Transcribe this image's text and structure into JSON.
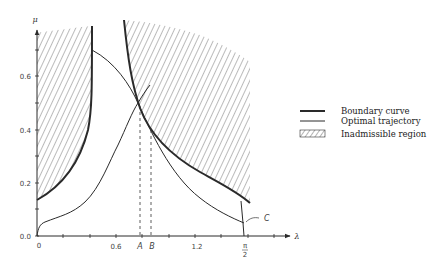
{
  "figure": {
    "axes": {
      "x_label": "λ",
      "y_label": "μ",
      "x_ticks": [
        {
          "label": "0",
          "value": 0
        },
        {
          "label": "0.6",
          "value": 0.6
        },
        {
          "label": "1.2",
          "value": 1.2
        }
      ],
      "x_special": [
        {
          "label": "A",
          "value": 0.78
        },
        {
          "label": "B",
          "value": 0.86
        },
        {
          "label_num": "π",
          "label_den": "2",
          "value": 1.5708
        }
      ],
      "y_ticks": [
        {
          "label": "0.0",
          "value": 0.0
        },
        {
          "label": "0.2",
          "value": 0.2
        },
        {
          "label": "0.4",
          "value": 0.4
        },
        {
          "label": "0.6",
          "value": 0.6
        }
      ]
    },
    "point_labels": {
      "c": "C"
    },
    "legend": [
      {
        "style": "thick-line",
        "label": "Boundary curve"
      },
      {
        "style": "thin-line",
        "label": "Optimal trajectory"
      },
      {
        "style": "hatched",
        "label": "Inadmissible region"
      }
    ],
    "colors": {
      "line": "#2a2a2a",
      "hatch": "#555555",
      "background": "#ffffff"
    }
  }
}
